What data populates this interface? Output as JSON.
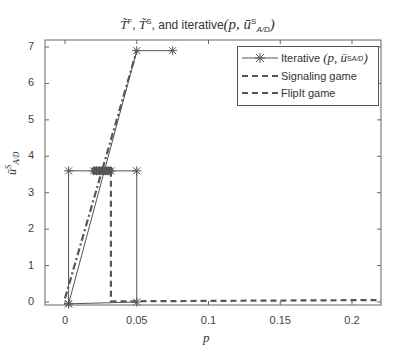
{
  "chart_data": {
    "type": "line",
    "title_parts": {
      "t1": "T̃",
      "s1": "F",
      "sep1": ", ",
      "t2": "T̃",
      "s2": "S",
      "rest": ", and iterative",
      "paren": "(p, ū",
      "sup": "S",
      "sub": "A/D",
      "close": ")"
    },
    "xlabel": "p",
    "ylabel": "ū^S_A/D",
    "xlim": [
      -0.014,
      0.22
    ],
    "ylim": [
      -0.1,
      7.2
    ],
    "x_ticks": [
      0,
      0.05,
      0.1,
      0.15,
      0.2
    ],
    "x_tick_labels": [
      "0",
      "0.05",
      "0.1",
      "0.15",
      "0.2"
    ],
    "y_ticks": [
      0,
      1,
      2,
      3,
      4,
      5,
      6,
      7
    ],
    "y_tick_labels": [
      "0",
      "1",
      "2",
      "3",
      "4",
      "5",
      "6",
      "7"
    ],
    "grid": false,
    "legend_position": "upper right",
    "series": [
      {
        "name": "Iterative (p, ū^S_A/D)",
        "style": "solid with asterisk markers",
        "color": "#555555",
        "x": [
          0.0025,
          0.0025,
          0.02,
          0.022,
          0.024,
          0.026,
          0.028,
          0.03,
          0.032,
          0.05,
          0.05,
          0.0025,
          0.05,
          0.075
        ],
        "y": [
          -0.05,
          3.6,
          3.6,
          3.6,
          3.6,
          3.6,
          3.6,
          3.6,
          3.6,
          3.6,
          0.0,
          -0.05,
          6.9,
          6.9
        ]
      },
      {
        "name": "Signaling game",
        "style": "dashed",
        "color": "#555555",
        "x": [
          0.032,
          0.032,
          0.05,
          0.1,
          0.15,
          0.2,
          0.22
        ],
        "y": [
          3.6,
          0.02,
          0.02,
          0.03,
          0.04,
          0.05,
          0.05
        ]
      },
      {
        "name": "FlipIt game",
        "style": "dash-dot",
        "color": "#555555",
        "x": [
          0.0,
          0.05
        ],
        "y": [
          0.1,
          6.9
        ]
      }
    ],
    "legend": [
      "Iterative (p, ū^S_A/D)",
      "Signaling game",
      "FlipIt game"
    ]
  },
  "legend": {
    "iterative_label": "Iterative",
    "iterative_math": "(p, ū",
    "iterative_sup": "S",
    "iterative_sub": "A/D",
    "iterative_close": ")",
    "signaling_label": "Signaling game",
    "flipit_label": "FlipIt game"
  },
  "axes": {
    "xlabel": "p",
    "ylabel": "ū",
    "ylabel_sup": "S",
    "ylabel_sub": "A/D"
  }
}
